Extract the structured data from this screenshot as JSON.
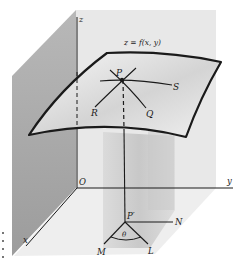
{
  "figure": {
    "type": "3d-surface-directional-derivative-diagram",
    "colors": {
      "background": "#ffffff",
      "back_wall": "#e6e6e6",
      "left_wall": "#a9a9a9",
      "floor": "#ececec",
      "surface_fill": "#f2f2f2",
      "surface_shade": "#cfcfcf",
      "column_shade": "#c4c4c4",
      "line": "#1a1a1a"
    },
    "labels": {
      "surface_equation": "z = f(x, y)",
      "z_axis": "z",
      "y_axis": "y",
      "x_axis": "x",
      "origin": "O",
      "point_on_surface": "P",
      "point_projection": "P′",
      "curve_r": "R",
      "curve_s": "S",
      "curve_q": "Q",
      "direction_n": "N",
      "direction_m": "M",
      "direction_l": "L",
      "angle": "θ"
    }
  }
}
